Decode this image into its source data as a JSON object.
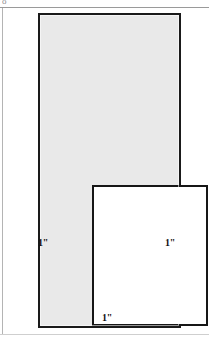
{
  "figure": {
    "type": "margin-layout-diagram",
    "page_outline": {
      "fill_color": "#e9e9e9",
      "border_color": "#1a1a1a"
    },
    "text_block": {
      "fill_color": "#ffffff",
      "border_color": "#161616"
    },
    "dimensions": [
      {
        "id": "left-margin",
        "label": "1\"",
        "position": "left"
      },
      {
        "id": "right-margin",
        "label": "1\"",
        "position": "right"
      },
      {
        "id": "bottom-margin",
        "label": "1\"",
        "position": "bottom"
      }
    ],
    "scan_artifacts": {
      "corner_glyph": "o",
      "top_rule_color": "#9a9a9a",
      "left_rule_color": "#b4b4b4",
      "bottom_rule_color": "#cfcfcf"
    }
  }
}
